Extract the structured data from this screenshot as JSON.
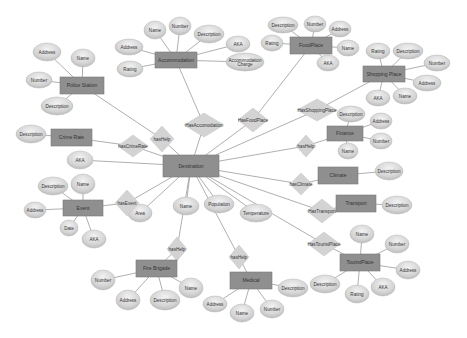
{
  "diagram": {
    "type": "er-diagram",
    "colors": {
      "entity_fill": "#8f8f8f",
      "attribute_fill": "#d6d6d6",
      "relationship_fill": "#d3d3d3",
      "edge": "#9a9a9a",
      "background": "#ffffff"
    },
    "entities": [
      {
        "id": "destination",
        "label": "Destination",
        "x": 163,
        "y": 155,
        "w": 56,
        "h": 22
      },
      {
        "id": "police",
        "label": "Police Station",
        "x": 60,
        "y": 77,
        "w": 44,
        "h": 17
      },
      {
        "id": "accommodation",
        "label": "Accommodation",
        "x": 155,
        "y": 52,
        "w": 42,
        "h": 16
      },
      {
        "id": "foodplace",
        "label": "FoodPlace",
        "x": 290,
        "y": 37,
        "w": 42,
        "h": 17
      },
      {
        "id": "shopping",
        "label": "Shopping Place",
        "x": 363,
        "y": 66,
        "w": 42,
        "h": 16
      },
      {
        "id": "crimerate",
        "label": "Crime Rate",
        "x": 51,
        "y": 129,
        "w": 41,
        "h": 17
      },
      {
        "id": "finance",
        "label": "Finance",
        "x": 327,
        "y": 126,
        "w": 36,
        "h": 15
      },
      {
        "id": "climate",
        "label": "Climate",
        "x": 318,
        "y": 167,
        "w": 40,
        "h": 17
      },
      {
        "id": "event",
        "label": "Event",
        "x": 63,
        "y": 200,
        "w": 40,
        "h": 16
      },
      {
        "id": "transport",
        "label": "Transport",
        "x": 336,
        "y": 195,
        "w": 40,
        "h": 17
      },
      {
        "id": "firebrigade",
        "label": "Fire Brigade",
        "x": 136,
        "y": 260,
        "w": 41,
        "h": 17
      },
      {
        "id": "medical",
        "label": "Medical",
        "x": 230,
        "y": 272,
        "w": 42,
        "h": 17
      },
      {
        "id": "touristplace",
        "label": "TouristPlace",
        "x": 340,
        "y": 254,
        "w": 40,
        "h": 17
      }
    ],
    "relationships": [
      {
        "id": "hasHelp1",
        "label": "hasHelp",
        "x": 150,
        "y": 126,
        "w": 24,
        "h": 26
      },
      {
        "id": "hasAccomodation",
        "label": "HasAccomodation",
        "x": 184,
        "y": 113,
        "w": 40,
        "h": 24
      },
      {
        "id": "hasFoodPlace",
        "label": "HasFoodPlace",
        "x": 238,
        "y": 108,
        "w": 30,
        "h": 24
      },
      {
        "id": "hasShoppingPlace",
        "label": "HasShoppingPlace",
        "x": 297,
        "y": 99,
        "w": 40,
        "h": 22
      },
      {
        "id": "hasCrimeRate",
        "label": "hasCrimeRate",
        "x": 118,
        "y": 135,
        "w": 30,
        "h": 22
      },
      {
        "id": "hasHelp2",
        "label": "hasHelp",
        "x": 296,
        "y": 135,
        "w": 20,
        "h": 22
      },
      {
        "id": "hasClimate",
        "label": "hasClimate",
        "x": 290,
        "y": 173,
        "w": 22,
        "h": 22
      },
      {
        "id": "hasEvent",
        "label": "hasEvent",
        "x": 115,
        "y": 190,
        "w": 24,
        "h": 26
      },
      {
        "id": "hasTransport",
        "label": "HasTransport",
        "x": 307,
        "y": 199,
        "w": 30,
        "h": 24
      },
      {
        "id": "hasTouristPlace",
        "label": "HasTouristPlace",
        "x": 308,
        "y": 232,
        "w": 32,
        "h": 24
      },
      {
        "id": "hasHelp3",
        "label": "hasHelp",
        "x": 167,
        "y": 237,
        "w": 20,
        "h": 24
      },
      {
        "id": "hasHelp4",
        "label": "hasHelp",
        "x": 229,
        "y": 245,
        "w": 20,
        "h": 24
      }
    ],
    "attributes": [
      {
        "label": "Address",
        "x": 47,
        "y": 52,
        "rx": 14,
        "ry": 9,
        "of": "police"
      },
      {
        "label": "Name",
        "x": 83,
        "y": 58,
        "rx": 12,
        "ry": 9,
        "of": "police"
      },
      {
        "label": "Number",
        "x": 39,
        "y": 80,
        "rx": 13,
        "ry": 8,
        "of": "police"
      },
      {
        "label": "Description",
        "x": 57,
        "y": 106,
        "rx": 16,
        "ry": 9,
        "of": "police"
      },
      {
        "label": "Name",
        "x": 155,
        "y": 30,
        "rx": 11,
        "ry": 9,
        "of": "accommodation"
      },
      {
        "label": "Number",
        "x": 180,
        "y": 26,
        "rx": 11,
        "ry": 9,
        "of": "accommodation"
      },
      {
        "label": "Description",
        "x": 209,
        "y": 34,
        "rx": 15,
        "ry": 9,
        "of": "accommodation"
      },
      {
        "label": "Address",
        "x": 129,
        "y": 47,
        "rx": 14,
        "ry": 8,
        "of": "accommodation"
      },
      {
        "label": "AKA",
        "x": 238,
        "y": 44,
        "rx": 12,
        "ry": 8,
        "of": "accommodation"
      },
      {
        "label": "Rating",
        "x": 130,
        "y": 69,
        "rx": 13,
        "ry": 8,
        "of": "accommodation"
      },
      {
        "label": "Accommodation Charge",
        "x": 245,
        "y": 62,
        "rx": 19,
        "ry": 9,
        "of": "accommodation"
      },
      {
        "label": "Description",
        "x": 283,
        "y": 25,
        "rx": 15,
        "ry": 8,
        "of": "foodplace"
      },
      {
        "label": "Number",
        "x": 315,
        "y": 24,
        "rx": 11,
        "ry": 8,
        "of": "foodplace"
      },
      {
        "label": "Address",
        "x": 340,
        "y": 29,
        "rx": 11,
        "ry": 8,
        "of": "foodplace"
      },
      {
        "label": "Rating",
        "x": 272,
        "y": 43,
        "rx": 11,
        "ry": 8,
        "of": "foodplace"
      },
      {
        "label": "Name",
        "x": 348,
        "y": 48,
        "rx": 11,
        "ry": 8,
        "of": "foodplace"
      },
      {
        "label": "AKA",
        "x": 328,
        "y": 63,
        "rx": 11,
        "ry": 8,
        "of": "foodplace"
      },
      {
        "label": "Rating",
        "x": 378,
        "y": 51,
        "rx": 12,
        "ry": 8,
        "of": "shopping"
      },
      {
        "label": "Description",
        "x": 408,
        "y": 51,
        "rx": 15,
        "ry": 8,
        "of": "shopping"
      },
      {
        "label": "Number",
        "x": 437,
        "y": 63,
        "rx": 13,
        "ry": 8,
        "of": "shopping"
      },
      {
        "label": "Address",
        "x": 427,
        "y": 83,
        "rx": 14,
        "ry": 8,
        "of": "shopping"
      },
      {
        "label": "AKA",
        "x": 378,
        "y": 98,
        "rx": 12,
        "ry": 8,
        "of": "shopping"
      },
      {
        "label": "Name",
        "x": 405,
        "y": 96,
        "rx": 12,
        "ry": 8,
        "of": "shopping"
      },
      {
        "label": "Description",
        "x": 31,
        "y": 134,
        "rx": 15,
        "ry": 9,
        "of": "crimerate"
      },
      {
        "label": "Description",
        "x": 351,
        "y": 114,
        "rx": 14,
        "ry": 8,
        "of": "finance"
      },
      {
        "label": "Address",
        "x": 381,
        "y": 121,
        "rx": 11,
        "ry": 8,
        "of": "finance"
      },
      {
        "label": "Number",
        "x": 381,
        "y": 141,
        "rx": 11,
        "ry": 8,
        "of": "finance"
      },
      {
        "label": "Name",
        "x": 348,
        "y": 151,
        "rx": 10,
        "ry": 8,
        "of": "finance"
      },
      {
        "label": "Description",
        "x": 389,
        "y": 171,
        "rx": 14,
        "ry": 9,
        "of": "climate"
      },
      {
        "label": "AKA",
        "x": 80,
        "y": 160,
        "rx": 13,
        "ry": 9,
        "of": "destination"
      },
      {
        "label": "Area",
        "x": 140,
        "y": 213,
        "rx": 12,
        "ry": 9,
        "of": "destination"
      },
      {
        "label": "Name",
        "x": 186,
        "y": 206,
        "rx": 13,
        "ry": 9,
        "of": "destination"
      },
      {
        "label": "Population",
        "x": 219,
        "y": 204,
        "rx": 15,
        "ry": 9,
        "of": "destination"
      },
      {
        "label": "Temperature",
        "x": 256,
        "y": 213,
        "rx": 16,
        "ry": 9,
        "of": "destination"
      },
      {
        "label": "Description",
        "x": 53,
        "y": 186,
        "rx": 15,
        "ry": 9,
        "of": "event"
      },
      {
        "label": "Name",
        "x": 83,
        "y": 184,
        "rx": 12,
        "ry": 10,
        "of": "event"
      },
      {
        "label": "Address",
        "x": 35,
        "y": 210,
        "rx": 11,
        "ry": 8,
        "of": "event"
      },
      {
        "label": "Date",
        "x": 69,
        "y": 228,
        "rx": 9,
        "ry": 8,
        "of": "event"
      },
      {
        "label": "AKA",
        "x": 94,
        "y": 239,
        "rx": 12,
        "ry": 9,
        "of": "event"
      },
      {
        "label": "Description",
        "x": 397,
        "y": 205,
        "rx": 15,
        "ry": 9,
        "of": "transport"
      },
      {
        "label": "Number",
        "x": 103,
        "y": 280,
        "rx": 12,
        "ry": 10,
        "of": "firebrigade"
      },
      {
        "label": "Address",
        "x": 128,
        "y": 300,
        "rx": 12,
        "ry": 10,
        "of": "firebrigade"
      },
      {
        "label": "Description",
        "x": 165,
        "y": 300,
        "rx": 15,
        "ry": 10,
        "of": "firebrigade"
      },
      {
        "label": "Name",
        "x": 191,
        "y": 288,
        "rx": 12,
        "ry": 10,
        "of": "firebrigade"
      },
      {
        "label": "Address",
        "x": 215,
        "y": 304,
        "rx": 12,
        "ry": 8,
        "of": "medical"
      },
      {
        "label": "Name",
        "x": 242,
        "y": 313,
        "rx": 12,
        "ry": 9,
        "of": "medical"
      },
      {
        "label": "Number",
        "x": 272,
        "y": 309,
        "rx": 12,
        "ry": 9,
        "of": "medical"
      },
      {
        "label": "Description",
        "x": 293,
        "y": 288,
        "rx": 15,
        "ry": 9,
        "of": "medical"
      },
      {
        "label": "Name",
        "x": 362,
        "y": 234,
        "rx": 12,
        "ry": 9,
        "of": "touristplace"
      },
      {
        "label": "Number",
        "x": 397,
        "y": 244,
        "rx": 12,
        "ry": 9,
        "of": "touristplace"
      },
      {
        "label": "Address",
        "x": 408,
        "y": 270,
        "rx": 12,
        "ry": 9,
        "of": "touristplace"
      },
      {
        "label": "AKA",
        "x": 383,
        "y": 287,
        "rx": 12,
        "ry": 9,
        "of": "touristplace"
      },
      {
        "label": "Rating",
        "x": 357,
        "y": 294,
        "rx": 12,
        "ry": 9,
        "of": "touristplace"
      },
      {
        "label": "Description",
        "x": 325,
        "y": 284,
        "rx": 15,
        "ry": 9,
        "of": "touristplace"
      },
      {
        "label": "Description",
        "x": 316,
        "y": 287,
        "rx": 0,
        "ry": 0,
        "of": "none"
      }
    ],
    "links": [
      [
        "destination",
        "hasHelp1"
      ],
      [
        "hasHelp1",
        "police"
      ],
      [
        "destination",
        "hasAccomodation"
      ],
      [
        "hasAccomodation",
        "accommodation"
      ],
      [
        "destination",
        "hasFoodPlace"
      ],
      [
        "hasFoodPlace",
        "foodplace"
      ],
      [
        "destination",
        "hasShoppingPlace"
      ],
      [
        "hasShoppingPlace",
        "shopping"
      ],
      [
        "destination",
        "hasCrimeRate"
      ],
      [
        "hasCrimeRate",
        "crimerate"
      ],
      [
        "destination",
        "hasHelp2"
      ],
      [
        "hasHelp2",
        "finance"
      ],
      [
        "destination",
        "hasClimate"
      ],
      [
        "hasClimate",
        "climate"
      ],
      [
        "destination",
        "hasEvent"
      ],
      [
        "hasEvent",
        "event"
      ],
      [
        "destination",
        "hasTransport"
      ],
      [
        "hasTransport",
        "transport"
      ],
      [
        "destination",
        "hasTouristPlace"
      ],
      [
        "hasTouristPlace",
        "touristplace"
      ],
      [
        "destination",
        "hasHelp3"
      ],
      [
        "hasHelp3",
        "firebrigade"
      ],
      [
        "destination",
        "hasHelp4"
      ],
      [
        "hasHelp4",
        "medical"
      ]
    ]
  }
}
